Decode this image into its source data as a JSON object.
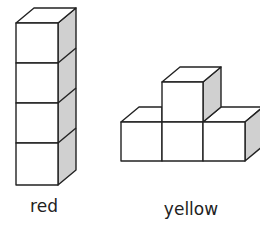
{
  "diagram": {
    "figures": [
      {
        "id": "red",
        "label": "red",
        "shape": "vertical tower of 4 cubes"
      },
      {
        "id": "yellow",
        "label": "yellow",
        "shape": "row of 3 cubes with 1 cube stacked on the middle"
      }
    ],
    "colors": {
      "line": "#222222",
      "face": "#ffffff",
      "side": "#d0d0d0"
    }
  }
}
